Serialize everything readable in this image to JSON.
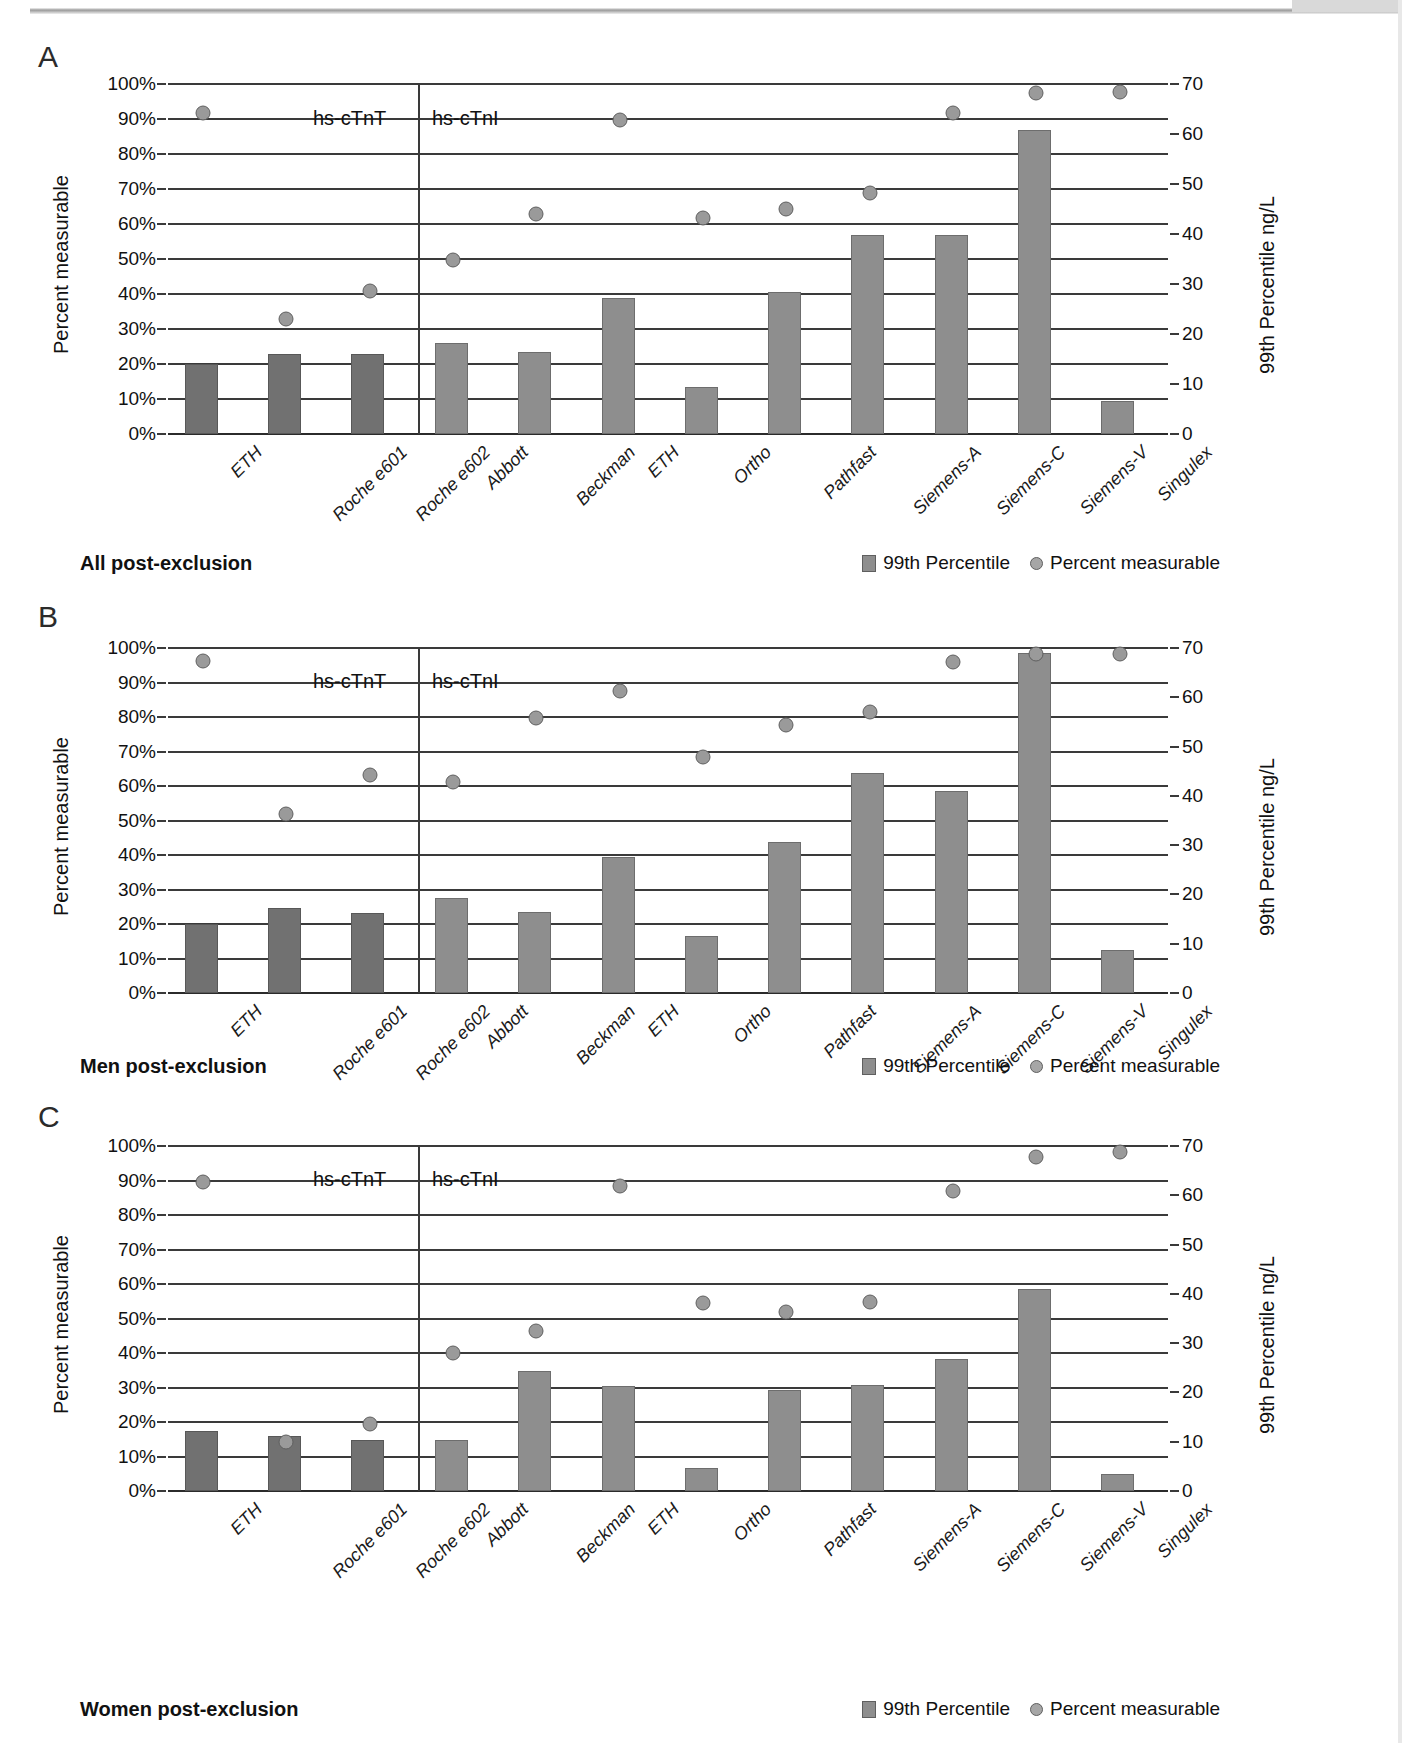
{
  "figure": {
    "panels": [
      "A",
      "B",
      "C"
    ]
  },
  "common": {
    "ylabel_left": "Percent measurable",
    "ylabel_right": "99th Percentile ng/L",
    "group_labels": [
      "hs-cTnT",
      "hs-cTnI"
    ],
    "legend": {
      "bar_label": "99th Percentile",
      "dot_label": "Percent measurable"
    },
    "yticks_left": [
      "0%",
      "10%",
      "20%",
      "30%",
      "40%",
      "50%",
      "60%",
      "70%",
      "80%",
      "90%",
      "100%"
    ],
    "yticks_right": [
      "0",
      "10",
      "20",
      "30",
      "40",
      "50",
      "60",
      "70"
    ],
    "categories": [
      "ETH",
      "Roche e601",
      "Roche e602",
      "Abbott",
      "Beckman",
      "ETH",
      "Ortho",
      "Pathfast",
      "Siemens-A",
      "Siemens-C",
      "Siemens-V",
      "Singulex"
    ],
    "colors": {
      "bar": "#8e8e8e",
      "bar_dark": "#717171",
      "dot": "#9a9a9a",
      "axis": "#3a3a3a",
      "text": "#111111"
    }
  },
  "chart_data": [
    {
      "panel": "A",
      "type": "bar",
      "title": "All post-exclusion",
      "xlabel": "",
      "ylabel": "Percent measurable",
      "ylabel2": "99th Percentile ng/L",
      "ylim": [
        0,
        100
      ],
      "ylim2": [
        0,
        70
      ],
      "grid": true,
      "legend_position": "bottom-right",
      "group_split_after": 3,
      "groups": [
        "hs-cTnT",
        "hs-cTnI"
      ],
      "categories": [
        "ETH",
        "Roche e601",
        "Roche e602",
        "Abbott",
        "Beckman",
        "ETH",
        "Ortho",
        "Pathfast",
        "Siemens-A",
        "Siemens-C",
        "Siemens-V",
        "Singulex"
      ],
      "series": [
        {
          "name": "99th Percentile",
          "unit": "ng/L",
          "axis": "right",
          "values": [
            14.0,
            16.1,
            16.1,
            18.2,
            16.5,
            27.3,
            9.5,
            28.4,
            39.9,
            39.9,
            60.9,
            6.7
          ]
        },
        {
          "name": "Percent measurable",
          "unit": "%",
          "axis": "left",
          "values": [
            94,
            35,
            43,
            52,
            65,
            92,
            64,
            66.5,
            71,
            94,
            99.5,
            100
          ]
        }
      ]
    },
    {
      "panel": "B",
      "type": "bar",
      "title": "Men post-exclusion",
      "xlabel": "",
      "ylabel": "Percent measurable",
      "ylabel2": "99th Percentile ng/L",
      "ylim": [
        0,
        100
      ],
      "ylim2": [
        0,
        70
      ],
      "grid": true,
      "legend_position": "bottom-right",
      "group_split_after": 3,
      "groups": [
        "hs-cTnT",
        "hs-cTnI"
      ],
      "categories": [
        "ETH",
        "Roche e601",
        "Roche e602",
        "Abbott",
        "Beckman",
        "ETH",
        "Ortho",
        "Pathfast",
        "Siemens-A",
        "Siemens-C",
        "Siemens-V",
        "Singulex"
      ],
      "series": [
        {
          "name": "99th Percentile",
          "unit": "ng/L",
          "axis": "right",
          "values": [
            14.0,
            17.3,
            16.3,
            19.3,
            16.5,
            27.6,
            11.6,
            30.7,
            44.6,
            41.0,
            68.9,
            8.7
          ]
        },
        {
          "name": "Percent measurable",
          "unit": "%",
          "axis": "left",
          "values": [
            98.3,
            54.2,
            65.3,
            63.2,
            82.0,
            89.6,
            70.7,
            79.8,
            83.5,
            98.1,
            100.5,
            100.5
          ]
        }
      ]
    },
    {
      "panel": "C",
      "type": "bar",
      "title": "Women post-exclusion",
      "xlabel": "",
      "ylabel": "Percent measurable",
      "ylabel2": "99th Percentile ng/L",
      "ylim": [
        0,
        100
      ],
      "ylim2": [
        0,
        70
      ],
      "grid": true,
      "legend_position": "bottom-right",
      "group_split_after": 3,
      "groups": [
        "hs-cTnT",
        "hs-cTnI"
      ],
      "categories": [
        "ETH",
        "Roche e601",
        "Roche e602",
        "Abbott",
        "Beckman",
        "ETH",
        "Ortho",
        "Pathfast",
        "Siemens-A",
        "Siemens-C",
        "Siemens-V",
        "Singulex"
      ],
      "series": [
        {
          "name": "99th Percentile",
          "unit": "ng/L",
          "axis": "right",
          "values": [
            12.1,
            11.2,
            10.4,
            10.4,
            24.4,
            21.4,
            4.6,
            20.5,
            21.5,
            26.8,
            41.0,
            3.4
          ]
        },
        {
          "name": "Percent measurable",
          "unit": "%",
          "axis": "left",
          "values": [
            91.8,
            16.3,
            21.5,
            42.2,
            48.5,
            90.5,
            56.8,
            54.0,
            57.0,
            89.0,
            99.0,
            100.5
          ]
        }
      ]
    }
  ]
}
